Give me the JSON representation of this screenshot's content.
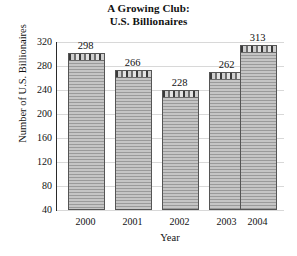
{
  "chart_data": {
    "type": "bar",
    "title": "A Growing Club: U.S. Billionaires",
    "title_line1": "A Growing Club:",
    "title_line2": "U.S. Billionaires",
    "xlabel": "Year",
    "ylabel": "Number of U.S. Billionaires",
    "categories": [
      "2000",
      "2001",
      "2002",
      "2003",
      "2004"
    ],
    "values": [
      298,
      266,
      228,
      262,
      313
    ],
    "data_labels": [
      "298",
      "266",
      "228",
      "262",
      "313"
    ],
    "ylim": [
      0,
      320
    ],
    "y_ticks": [
      40,
      80,
      120,
      160,
      200,
      240,
      280,
      320
    ],
    "y_tick_labels": [
      "40",
      "80",
      "120",
      "160",
      "200",
      "240",
      "280",
      "320"
    ],
    "grid": true,
    "grid_axis": "y",
    "legend": null,
    "bar_color": "#a9a9a9",
    "bar_edge_color": "#555555",
    "grid_color": "#d8d8d8",
    "axis_color": "#2a2a2a",
    "background_color": "#ffffff"
  }
}
